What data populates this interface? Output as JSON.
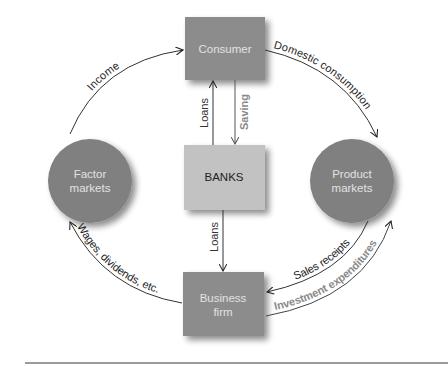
{
  "diagram": {
    "nodes": {
      "consumer": {
        "label": "Consumer",
        "shape": "box",
        "fill": "#8c8c8c",
        "text_color": "#e2e2e2"
      },
      "banks": {
        "label": "BANKS",
        "shape": "box",
        "fill": "#c2c2c2",
        "text_color": "#222222"
      },
      "business_line1": {
        "label": "Business",
        "shape": "box",
        "fill": "#8c8c8c",
        "text_color": "#e2e2e2"
      },
      "business_line2": {
        "label": "firm"
      },
      "factor_line1": {
        "label": "Factor",
        "shape": "circle",
        "fill": "#808080",
        "text_color": "#e2e2e2"
      },
      "factor_line2": {
        "label": "markets"
      },
      "product_line1": {
        "label": "Product",
        "shape": "circle",
        "fill": "#808080",
        "text_color": "#e2e2e2"
      },
      "product_line2": {
        "label": "markets"
      }
    },
    "flows": {
      "income": {
        "label": "Income",
        "from": "Factor markets",
        "to": "Consumer",
        "color": "#222222"
      },
      "domestic_consumption": {
        "label": "Domestic consumption",
        "from": "Consumer",
        "to": "Product markets",
        "color": "#222222"
      },
      "loans_to_consumer": {
        "label": "Loans",
        "from": "BANKS",
        "to": "Consumer",
        "color": "#333333"
      },
      "saving": {
        "label": "Saving",
        "from": "Consumer",
        "to": "BANKS",
        "color": "#8a8a8a"
      },
      "loans_to_business": {
        "label": "Loans",
        "from": "BANKS",
        "to": "Business firm",
        "color": "#333333"
      },
      "wages": {
        "label": "Wages, dividends, etc.",
        "from": "Business firm",
        "to": "Factor markets",
        "color": "#222222"
      },
      "sales_receipts": {
        "label": "Sales receipts",
        "from": "Product markets",
        "to": "Business firm",
        "color": "#222222"
      },
      "investment_expenditures": {
        "label": "Investment expenditures",
        "from": "Business firm",
        "to": "Product markets",
        "color": "#8a8a8a"
      }
    }
  }
}
